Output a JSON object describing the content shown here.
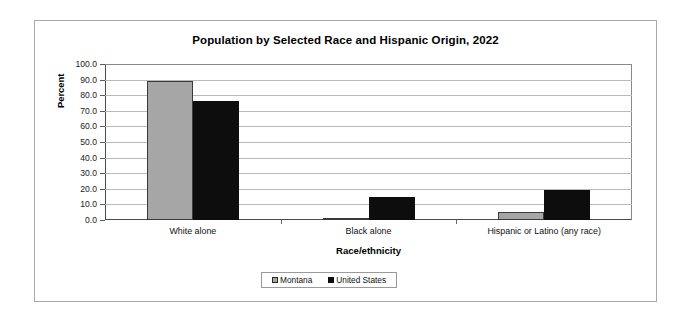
{
  "chart_data": {
    "type": "bar",
    "title": "Population by Selected Race and Hispanic Origin, 2022",
    "xlabel": "Race/ethnicity",
    "ylabel": "Percent",
    "ylim": [
      0,
      100
    ],
    "ytick_step": 10,
    "ytick_labels": [
      "100.0",
      "90.0",
      "80.0",
      "70.0",
      "60.0",
      "50.0",
      "40.0",
      "30.0",
      "20.0",
      "10.0",
      "0.0"
    ],
    "grid": true,
    "legend_position": "bottom-center",
    "categories": [
      "White alone",
      "Black alone",
      "Hispanic or Latino (any race)"
    ],
    "series": [
      {
        "name": "Montana",
        "color": "#a6a6a6",
        "values": [
          89.2,
          0.6,
          5.1
        ]
      },
      {
        "name": "United States",
        "color": "#0d0d0d",
        "values": [
          76.5,
          14.8,
          19.4
        ]
      }
    ]
  }
}
